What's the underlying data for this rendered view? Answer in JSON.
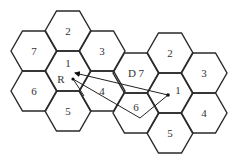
{
  "diagram": {
    "type": "cellular-hexagon-clusters",
    "hex": {
      "radius": 23,
      "half_height": 20
    },
    "clusters": [
      {
        "name": "left-cluster",
        "cells": [
          {
            "label": "2",
            "cx": 68,
            "cy": 31
          },
          {
            "label": "7",
            "cx": 34,
            "cy": 51
          },
          {
            "label": "3",
            "cx": 102,
            "cy": 51
          },
          {
            "label": "1",
            "cx": 68,
            "cy": 71
          },
          {
            "label": "6",
            "cx": 34,
            "cy": 91
          },
          {
            "label": "4",
            "cx": 102,
            "cy": 91
          },
          {
            "label": "5",
            "cx": 68,
            "cy": 111
          }
        ]
      },
      {
        "name": "right-cluster",
        "cells": [
          {
            "label": "2",
            "cx": 170,
            "cy": 53
          },
          {
            "label": "D 7",
            "cx": 136,
            "cy": 73
          },
          {
            "label": "3",
            "cx": 204,
            "cy": 73
          },
          {
            "label": "1",
            "cx": 170,
            "cy": 93
          },
          {
            "label": "6",
            "cx": 136,
            "cy": 113
          },
          {
            "label": "4",
            "cx": 204,
            "cy": 113
          },
          {
            "label": "5",
            "cx": 170,
            "cy": 133
          }
        ]
      }
    ],
    "labels": {
      "receiver": "R",
      "left_center": "1",
      "right_center": "1",
      "desired_cell": "D 7"
    },
    "points": {
      "receiver": {
        "x": 73,
        "y": 79
      },
      "source": {
        "x": 168,
        "y": 95
      }
    },
    "paths": [
      {
        "name": "direct-path",
        "from": [
          168,
          95
        ],
        "to": [
          75,
          73
        ],
        "arrow": true
      },
      {
        "name": "reflected-path",
        "points": [
          [
            168,
            95
          ],
          [
            140,
            118
          ],
          [
            73,
            79
          ]
        ],
        "arrow": false
      },
      {
        "name": "short-branch",
        "points": [
          [
            73,
            79
          ],
          [
            79,
            88
          ],
          [
            84,
            96
          ]
        ],
        "arrow": false
      }
    ],
    "colors": {
      "stroke": "#2a2a2a",
      "text": "#333333",
      "background": "#ffffff"
    }
  }
}
